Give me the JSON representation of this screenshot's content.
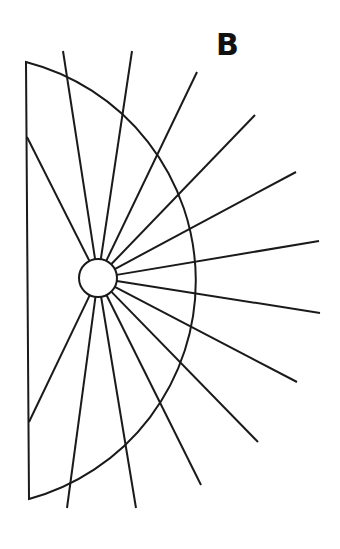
{
  "figure": {
    "label": "B",
    "stroke_color": "#1a1a1a",
    "background": "#ffffff",
    "hub": {
      "cx": 98,
      "cy": 278,
      "r": 19
    },
    "arc": {
      "cx": 98,
      "cy": 278,
      "r": 226,
      "start": [
        26,
        62
      ],
      "end": [
        29,
        499
      ]
    },
    "straight_edge": {
      "x1": 26,
      "y1": 62,
      "x2": 29,
      "y2": 499
    },
    "spokes": [
      [
        27,
        137
      ],
      [
        63,
        51
      ],
      [
        132,
        51
      ],
      [
        197,
        72
      ],
      [
        255,
        115
      ],
      [
        296,
        172
      ],
      [
        319,
        241
      ],
      [
        320,
        313
      ],
      [
        297,
        382
      ],
      [
        258,
        442
      ],
      [
        201,
        485
      ],
      [
        136,
        508
      ],
      [
        67,
        508
      ],
      [
        29,
        422
      ]
    ]
  }
}
